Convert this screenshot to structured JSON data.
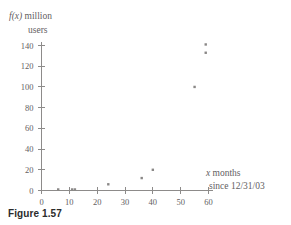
{
  "figure": {
    "caption": "Figure 1.57"
  },
  "chart_data": {
    "type": "scatter",
    "title": "",
    "subtitle": "",
    "ylabel_line1_var": "f(x)",
    "ylabel_line1_rest": " million",
    "ylabel_line2": "users",
    "xlabel_line1_var": "x",
    "xlabel_line1_rest": " months",
    "xlabel_line2": "since 12/31/03",
    "ylabel": "f(x) million users",
    "xlabel": "x months since 12/31/03",
    "xlim": [
      0,
      62
    ],
    "ylim": [
      0,
      147
    ],
    "xticks": [
      0,
      10,
      20,
      30,
      40,
      50,
      60
    ],
    "xtick_labels": [
      "0",
      "10",
      "20",
      "30",
      "40",
      "50",
      "60"
    ],
    "yticks": [
      0,
      20,
      40,
      60,
      80,
      100,
      120,
      140
    ],
    "ytick_labels": [
      "0",
      "20",
      "40",
      "60",
      "80",
      "100",
      "120",
      "140"
    ],
    "grid": false,
    "legend": false,
    "marker": "dot",
    "marker_color": "#8a8887",
    "axis_color": "#8d8b8a",
    "x": [
      6,
      11,
      12,
      24,
      36,
      40,
      55,
      59,
      59
    ],
    "y": [
      1,
      1,
      1,
      6,
      12,
      20,
      100,
      133,
      141
    ],
    "points": [
      {
        "x": 6,
        "y": 1
      },
      {
        "x": 11,
        "y": 1
      },
      {
        "x": 12,
        "y": 1
      },
      {
        "x": 24,
        "y": 6
      },
      {
        "x": 36,
        "y": 12
      },
      {
        "x": 40,
        "y": 20
      },
      {
        "x": 55,
        "y": 100
      },
      {
        "x": 59,
        "y": 133
      },
      {
        "x": 59,
        "y": 141
      }
    ]
  }
}
